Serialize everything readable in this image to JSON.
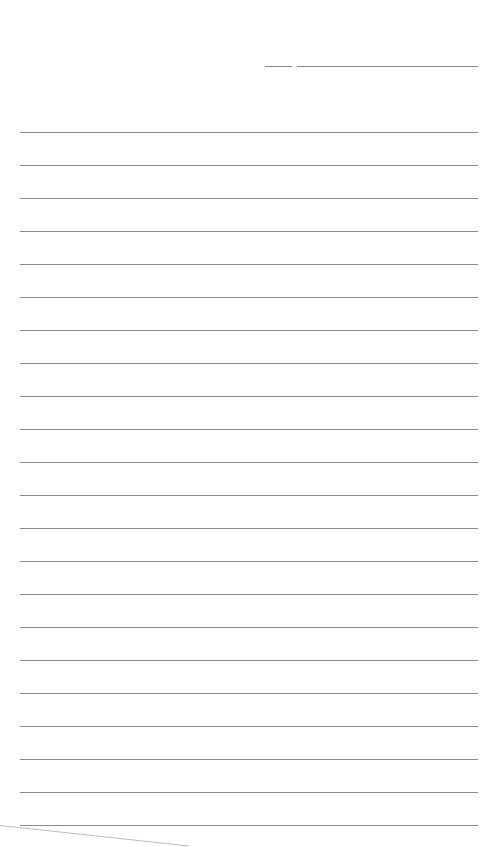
{
  "page": {
    "type": "lined-notepaper",
    "background": "#ffffff",
    "rule_color": "#8c8c8c",
    "header": {
      "short_line": {
        "x1": 265,
        "x2": 292,
        "y": 66
      },
      "long_line": {
        "x1": 297,
        "x2": 478,
        "y": 66
      }
    },
    "rules": {
      "count": 22,
      "first_y": 132,
      "spacing": 33,
      "x1": 20,
      "x2": 478
    },
    "text": []
  }
}
